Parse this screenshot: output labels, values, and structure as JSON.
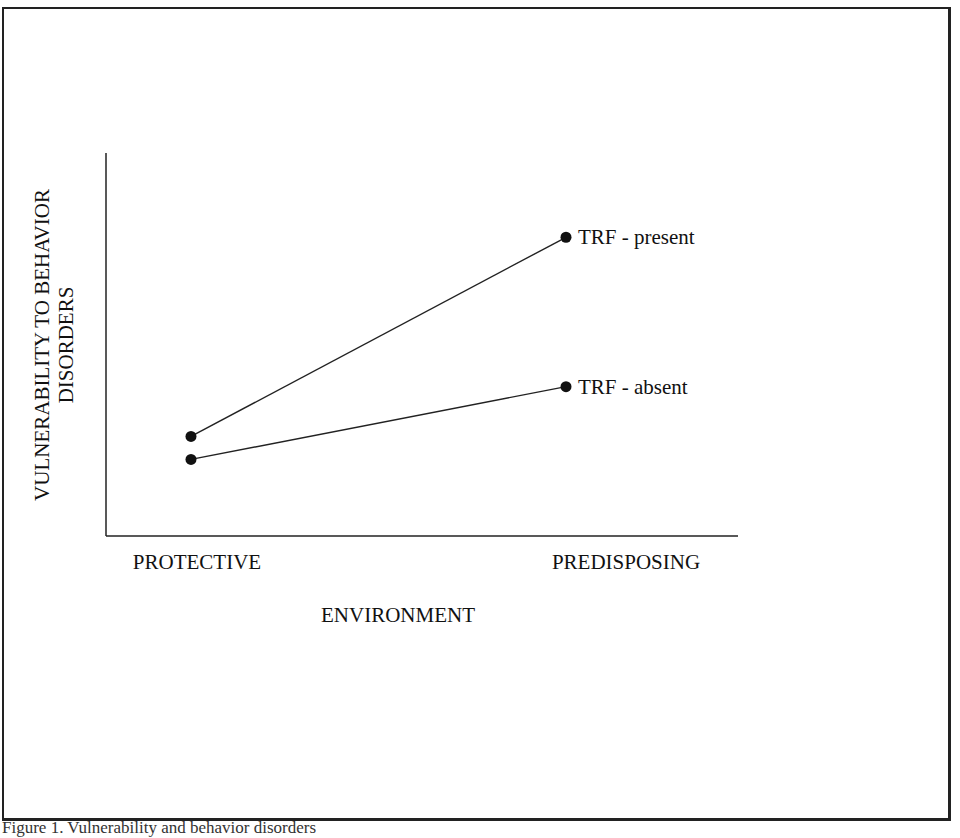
{
  "chart_data": {
    "type": "line",
    "title": "",
    "xlabel": "ENVIRONMENT",
    "ylabel_lines": [
      "VULNERABILITY TO BEHAVIOR",
      "DISORDERS"
    ],
    "categories": [
      "PROTECTIVE",
      "PREDISPOSING"
    ],
    "ylim": [
      0,
      10
    ],
    "y_ticks_shown": false,
    "grid": false,
    "legend": "inline-right-of-endpoints",
    "series": [
      {
        "name": "TRF - present",
        "values": [
          2.6,
          7.8
        ]
      },
      {
        "name": "TRF - absent",
        "values": [
          2.0,
          3.9
        ]
      }
    ]
  },
  "caption": "Figure 1. Vulnerability and behavior disorders"
}
